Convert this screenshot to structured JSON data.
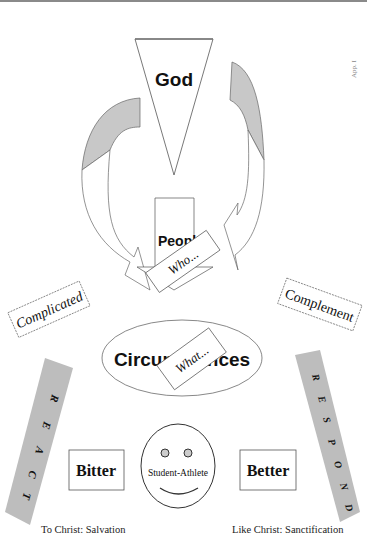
{
  "diagram": {
    "top": {
      "label": "God",
      "shape": "inverted-triangle"
    },
    "page_mark": "App. I",
    "center_arrow": {
      "label": "People",
      "banner": "Who..."
    },
    "ellipse": {
      "label": "Circumstances",
      "banner": "What..."
    },
    "left_box": {
      "label": "Complicated"
    },
    "right_box": {
      "label": "Complement"
    },
    "left_bar": {
      "label": "REACT",
      "letters": [
        "R",
        "E",
        "A",
        "C",
        "T"
      ]
    },
    "right_bar": {
      "label": "RESPOND",
      "letters": [
        "R",
        "E",
        "S",
        "P",
        "O",
        "N",
        "D"
      ]
    },
    "left_outcome": {
      "label": "Bitter"
    },
    "right_outcome": {
      "label": "Better"
    },
    "face": {
      "label": "Student-Athlete"
    },
    "left_caption": "To Christ: Salvation",
    "right_caption": "Like Christ: Sanctification",
    "colors": {
      "line": "#555555",
      "fill_gray": "#c8c8c8",
      "bar_gray": "#bdbdbd",
      "text": "#111111"
    }
  }
}
